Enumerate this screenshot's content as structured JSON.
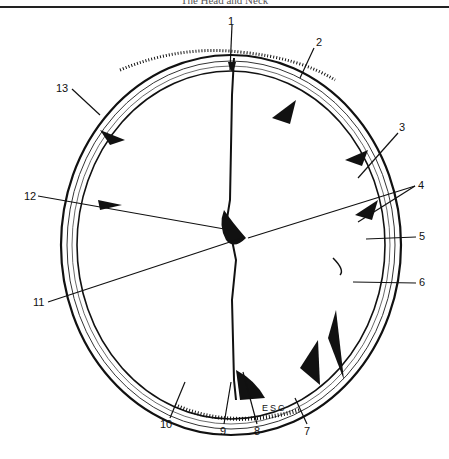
{
  "header": {
    "running_title": "The Head and Neck"
  },
  "figure": {
    "labels": [
      {
        "id": "1",
        "text": "1",
        "x": 228,
        "y": 16
      },
      {
        "id": "2",
        "text": "2",
        "x": 316,
        "y": 39
      },
      {
        "id": "3",
        "text": "3",
        "x": 399,
        "y": 124
      },
      {
        "id": "4",
        "text": "4",
        "x": 418,
        "y": 182
      },
      {
        "id": "5",
        "text": "5",
        "x": 419,
        "y": 233
      },
      {
        "id": "6",
        "text": "6",
        "x": 419,
        "y": 279
      },
      {
        "id": "7",
        "text": "7",
        "x": 305,
        "y": 427
      },
      {
        "id": "8",
        "text": "8",
        "x": 254,
        "y": 427
      },
      {
        "id": "9",
        "text": "9",
        "x": 220,
        "y": 427
      },
      {
        "id": "10",
        "text": "10",
        "x": 166,
        "y": 420
      },
      {
        "id": "11",
        "text": "11",
        "x": 38,
        "y": 299
      },
      {
        "id": "12",
        "text": "12",
        "x": 26,
        "y": 193
      },
      {
        "id": "13",
        "text": "13",
        "x": 60,
        "y": 84
      }
    ],
    "inline_text": {
      "esc": "ESC"
    }
  }
}
